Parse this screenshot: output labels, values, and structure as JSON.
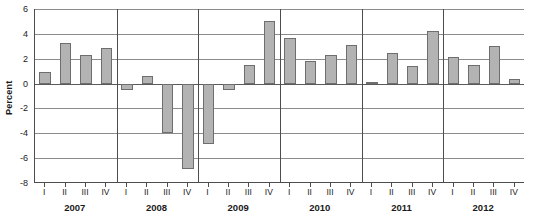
{
  "chart_data": {
    "type": "bar",
    "title": "",
    "xlabel": "",
    "ylabel": "Percent",
    "ylim": [
      -8,
      6
    ],
    "yticks": [
      6,
      4,
      2,
      0,
      -2,
      -4,
      -6,
      -8
    ],
    "ytick_labels": [
      "6",
      "4",
      "2",
      "0",
      "-2",
      "-4",
      "-6",
      "-8"
    ],
    "grid": true,
    "legend": "none",
    "groups": [
      "2007",
      "2008",
      "2009",
      "2010",
      "2011",
      "2012"
    ],
    "quarters": [
      "I",
      "II",
      "III",
      "IV"
    ],
    "categories": [
      "2007 I",
      "2007 II",
      "2007 III",
      "2007 IV",
      "2008 I",
      "2008 II",
      "2008 III",
      "2008 IV",
      "2009 I",
      "2009 II",
      "2009 III",
      "2009 IV",
      "2010 I",
      "2010 II",
      "2010 III",
      "2010 IV",
      "2011 I",
      "2011 II",
      "2011 III",
      "2011 IV",
      "2012 I",
      "2012 II",
      "2012 III",
      "2012 IV"
    ],
    "values": [
      0.9,
      3.3,
      2.3,
      2.9,
      -0.5,
      0.6,
      -4.0,
      -6.9,
      -4.9,
      -0.5,
      1.5,
      5.0,
      3.7,
      1.8,
      2.3,
      3.1,
      0.1,
      2.5,
      1.4,
      4.2,
      2.1,
      1.5,
      3.0,
      0.4
    ],
    "bar_color": "#b3b3b3",
    "bar_edge_color": "#6e6e6e",
    "axis_color": "#4d4d4d",
    "grid_color": "#8c8c8c"
  }
}
